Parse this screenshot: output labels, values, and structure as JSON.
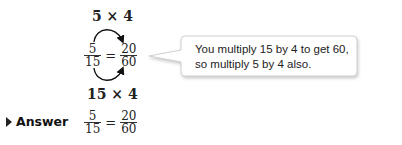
{
  "worked_example": {
    "top_expression": "5 × 4",
    "bottom_expression": "15 × 4",
    "equation": {
      "left": {
        "numerator": "5",
        "denominator": "15"
      },
      "operator": "=",
      "right": {
        "numerator": "20",
        "denominator": "60"
      }
    },
    "callout": {
      "line1": "You multiply 15 by 4 to get 60,",
      "line2": "so multiply 5 by 4 also."
    }
  },
  "answer": {
    "label": "Answer",
    "equation": {
      "left": {
        "numerator": "5",
        "denominator": "15"
      },
      "operator": "=",
      "right": {
        "numerator": "20",
        "denominator": "60"
      }
    }
  }
}
